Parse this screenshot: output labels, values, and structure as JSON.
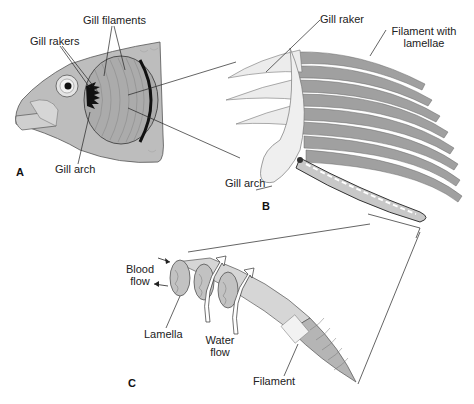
{
  "figure": {
    "panels": [
      {
        "id": "A",
        "letter": "A",
        "description": "Fish head with operculum removed showing gills"
      },
      {
        "id": "B",
        "letter": "B",
        "description": "Single gill arch with rakers and filaments"
      },
      {
        "id": "C",
        "letter": "C",
        "description": "Single filament with lamellae"
      }
    ],
    "labels": {
      "gill_filaments": "Gill filaments",
      "gill_rakers": "Gill rakers",
      "gill_arch_a": "Gill arch",
      "gill_raker": "Gill raker",
      "filament_with_lamellae_1": "Filament with",
      "filament_with_lamellae_2": "lamellae",
      "gill_arch_b": "Gill arch",
      "blood_flow_1": "Blood",
      "blood_flow_2": "flow",
      "lamella": "Lamella",
      "water_flow_1": "Water",
      "water_flow_2": "flow",
      "filament": "Filament"
    },
    "colors": {
      "ink": "#222222",
      "fish_body": "#b8b8b8",
      "fish_light": "#d9d9d9",
      "gill": "#a8a8a8",
      "arch": "#ececec",
      "filament": "#9a9a9a"
    }
  }
}
